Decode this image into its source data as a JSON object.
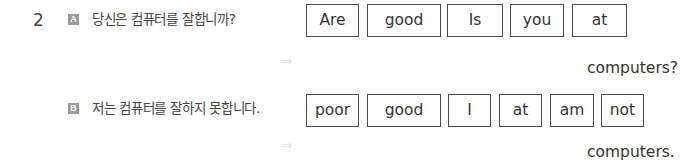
{
  "question": {
    "number": "2",
    "items": [
      {
        "badge": "A",
        "prompt_ko": "당신은 컴퓨터를 잘합니까?",
        "word_boxes": [
          "Are",
          "good",
          "Is",
          "you",
          "at"
        ],
        "arrow_icon": "double-arrow-right-icon",
        "answer_suffix": "computers?"
      },
      {
        "badge": "B",
        "prompt_ko": "저는 컴퓨터를 잘하지 못합니다.",
        "word_boxes": [
          "poor",
          "good",
          "I",
          "at",
          "am",
          "not"
        ],
        "arrow_icon": "double-arrow-right-icon",
        "answer_suffix": "computers."
      }
    ]
  },
  "colors": {
    "text": "#333333",
    "badge_bg": "#9a9a9a",
    "box_border": "#4a4a4a",
    "arrow": "#dcdcdc"
  }
}
